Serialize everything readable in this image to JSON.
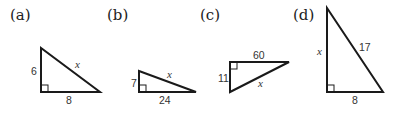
{
  "figure": {
    "panels": [
      {
        "id": "a",
        "label": "(a)",
        "legs": [
          "6",
          "8"
        ],
        "hypotenuse": "x",
        "labels": {
          "left": "6",
          "bottom": "8",
          "hyp": "x"
        }
      },
      {
        "id": "b",
        "label": "(b)",
        "legs": [
          "7",
          "24"
        ],
        "hypotenuse": "x",
        "labels": {
          "left": "7",
          "bottom": "24",
          "hyp": "x"
        }
      },
      {
        "id": "c",
        "label": "(c)",
        "legs": [
          "11",
          "60"
        ],
        "hypotenuse": "x",
        "labels": {
          "left": "11",
          "top": "60",
          "hyp": "x"
        }
      },
      {
        "id": "d",
        "label": "(d)",
        "legs": [
          "x",
          "8"
        ],
        "hypotenuse": "17",
        "labels": {
          "left": "x",
          "bottom": "8",
          "hyp": "17"
        }
      }
    ]
  }
}
